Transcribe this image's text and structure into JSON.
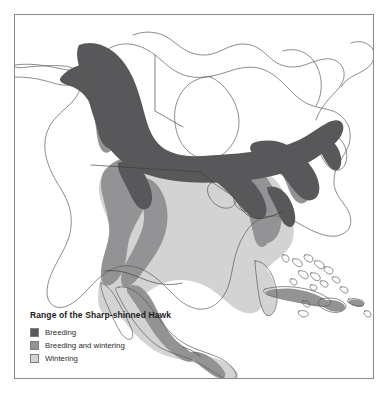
{
  "figure": {
    "kind": "range-map",
    "region": "North America",
    "background_color": "#ffffff",
    "frame_color": "#8a8a8a"
  },
  "legend": {
    "title": "Range of the Sharp-shinned Hawk",
    "items": [
      {
        "label": "Breeding",
        "color": "#58585a"
      },
      {
        "label": "Breeding and wintering",
        "color": "#939395"
      },
      {
        "label": "Wintering",
        "color": "#d3d3d3"
      }
    ]
  },
  "map_style": {
    "land_fill": "#ffffff",
    "coastline_color": "#5a5a5a",
    "border_color": "#4a4a4a",
    "breeding_fill": "#58585a",
    "breeding_wintering_fill": "#939395",
    "wintering_fill": "#d3d3d3"
  }
}
